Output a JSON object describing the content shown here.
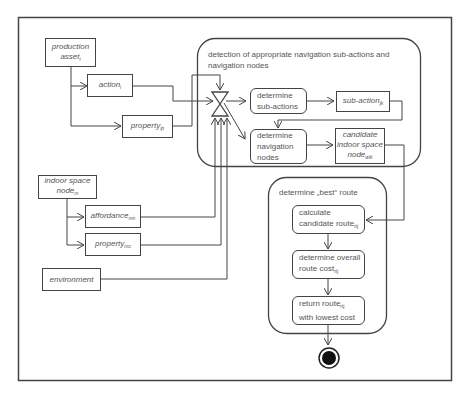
{
  "diagram": {
    "inputs": {
      "production_asset": {
        "main": "production asset",
        "sub": "i"
      },
      "action": {
        "main": "action",
        "sub": "i"
      },
      "property_asset": {
        "main": "property",
        "sub": "ip"
      },
      "indoor_space_node": {
        "line1": "indoor space",
        "main": "node",
        "sub": "m"
      },
      "affordance": {
        "main": "affordance",
        "sub": "mn"
      },
      "property_node": {
        "main": "property",
        "sub": "mc"
      },
      "environment": {
        "main": "environment"
      }
    },
    "detection_group": {
      "title": "detection of appropriate navigation sub-actions and navigation nodes",
      "determine_sub_actions": {
        "line1": "determine",
        "line2": "sub-actions"
      },
      "sub_action": {
        "main": "sub-action",
        "sub": "jk"
      },
      "determine_navigation_nodes": {
        "line1": "determine",
        "line2": "navigation",
        "line3": "nodes"
      },
      "candidate_node": {
        "line1": "candidate",
        "line2": "indoor space",
        "main": "node",
        "sub": "wlk"
      }
    },
    "best_route_group": {
      "title": "determine „best“ route",
      "calculate": {
        "line1": "calculate",
        "main": "candidate route",
        "sub": "rij"
      },
      "overall_cost": {
        "line1": "determine overall",
        "main": "route cost",
        "sub": "rij"
      },
      "return_route": {
        "main": "return route",
        "sub": "rij",
        "line2": "with lowest cost"
      }
    },
    "final_node": "activity-final"
  }
}
